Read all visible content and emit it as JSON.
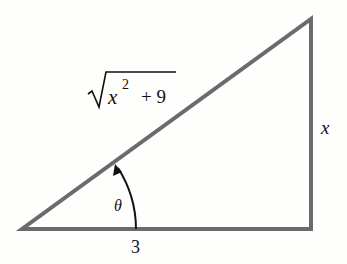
{
  "diagram": {
    "type": "right-triangle",
    "labels": {
      "hypotenuse_var": "x",
      "hypotenuse_exp": "2",
      "hypotenuse_rest": "+ 9",
      "opposite": "x",
      "adjacent": "3",
      "angle": "θ"
    },
    "colors": {
      "stroke": "#6b6b6b",
      "text": "#111111",
      "background": "#fefefc"
    }
  }
}
